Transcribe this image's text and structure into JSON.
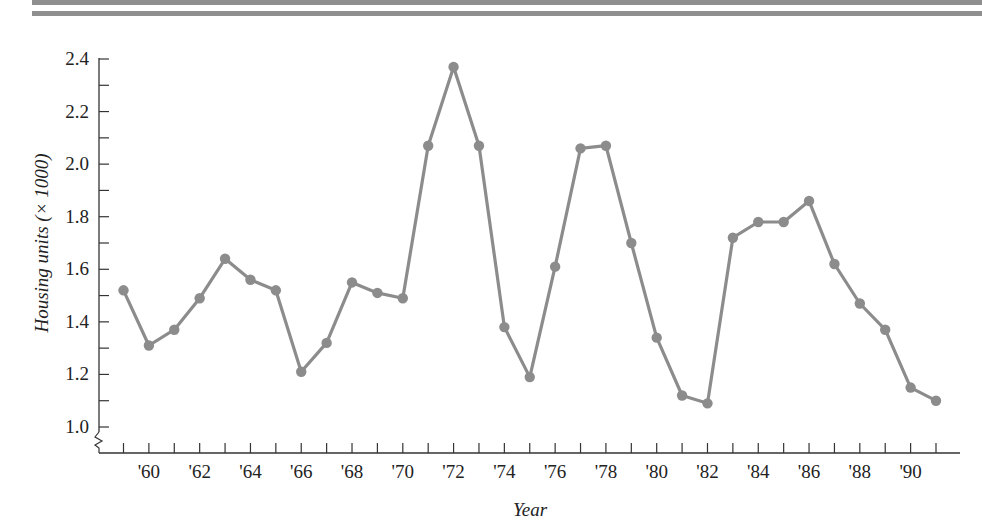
{
  "chart_data": {
    "type": "line",
    "title": "",
    "xlabel": "Year",
    "ylabel": "Housing units (× 1000)",
    "x": [
      1959,
      1960,
      1961,
      1962,
      1963,
      1964,
      1965,
      1966,
      1967,
      1968,
      1969,
      1970,
      1971,
      1972,
      1973,
      1974,
      1975,
      1976,
      1977,
      1978,
      1979,
      1980,
      1981,
      1982,
      1983,
      1984,
      1985,
      1986,
      1987,
      1988,
      1989,
      1990,
      1991
    ],
    "series": [
      {
        "name": "Housing units",
        "color": "#8c8c8c",
        "values": [
          1.52,
          1.31,
          1.37,
          1.49,
          1.64,
          1.56,
          1.52,
          1.21,
          1.32,
          1.55,
          1.51,
          1.49,
          2.07,
          2.37,
          2.07,
          1.38,
          1.19,
          1.61,
          2.06,
          2.07,
          1.7,
          1.34,
          1.12,
          1.09,
          1.72,
          1.78,
          1.78,
          1.86,
          1.62,
          1.47,
          1.37,
          1.15,
          1.1
        ]
      }
    ],
    "x_tick_labels": [
      "'60",
      "'62",
      "'64",
      "'66",
      "'68",
      "'70",
      "'72",
      "'74",
      "'76",
      "'78",
      "'80",
      "'82",
      "'84",
      "'86",
      "'88",
      "'90"
    ],
    "x_tick_label_years": [
      1960,
      1962,
      1964,
      1966,
      1968,
      1970,
      1972,
      1974,
      1976,
      1978,
      1980,
      1982,
      1984,
      1986,
      1988,
      1990
    ],
    "y_tick_labels": [
      "1.0",
      "1.2",
      "1.4",
      "1.6",
      "1.8",
      "2.0",
      "2.2",
      "2.4"
    ],
    "y_tick_values": [
      1.0,
      1.2,
      1.4,
      1.6,
      1.8,
      2.0,
      2.2,
      2.4
    ],
    "y_minor_step": 0.1,
    "xlim": [
      1958,
      1992
    ],
    "ylim": [
      1.0,
      2.4
    ],
    "y_axis_break": true,
    "grid": false,
    "legend": "none"
  }
}
